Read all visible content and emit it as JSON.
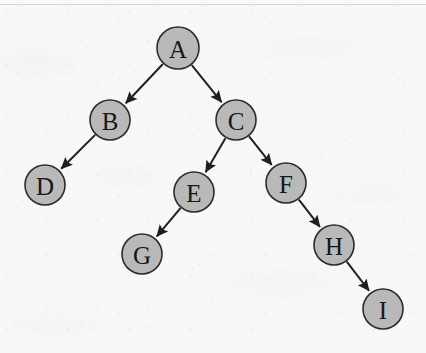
{
  "diagram": {
    "background_color": "#f8f8f7",
    "node_fill_color": "#b9b9b9",
    "node_stroke_color": "#2b2b2b",
    "edge_color": "#1f1f1f",
    "label_color": "#161616"
  },
  "chart_data": {
    "type": "diagram",
    "title": "",
    "nodes": [
      {
        "id": "A",
        "label": "A",
        "cx": 178,
        "cy": 48,
        "r": 21
      },
      {
        "id": "B",
        "label": "B",
        "cx": 110,
        "cy": 120,
        "r": 20
      },
      {
        "id": "C",
        "label": "C",
        "cx": 236,
        "cy": 120,
        "r": 20
      },
      {
        "id": "D",
        "label": "D",
        "cx": 45,
        "cy": 185,
        "r": 20
      },
      {
        "id": "E",
        "label": "E",
        "cx": 194,
        "cy": 192,
        "r": 20
      },
      {
        "id": "F",
        "label": "F",
        "cx": 286,
        "cy": 183,
        "r": 20
      },
      {
        "id": "G",
        "label": "G",
        "cx": 142,
        "cy": 254,
        "r": 20
      },
      {
        "id": "H",
        "label": "H",
        "cx": 334,
        "cy": 245,
        "r": 20
      },
      {
        "id": "I",
        "label": "I",
        "cx": 383,
        "cy": 309,
        "r": 20
      }
    ],
    "edges": [
      {
        "from": "A",
        "to": "B",
        "directed": true
      },
      {
        "from": "A",
        "to": "C",
        "directed": true
      },
      {
        "from": "B",
        "to": "D",
        "directed": true
      },
      {
        "from": "C",
        "to": "E",
        "directed": true
      },
      {
        "from": "C",
        "to": "F",
        "directed": true
      },
      {
        "from": "E",
        "to": "G",
        "directed": true
      },
      {
        "from": "F",
        "to": "H",
        "directed": true
      },
      {
        "from": "H",
        "to": "I",
        "directed": true
      }
    ]
  }
}
